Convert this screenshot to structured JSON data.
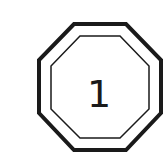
{
  "badge": {
    "label": "1",
    "shape": "octagon",
    "stroke_color": "#1a1a1a",
    "fill_color": "#ffffff"
  }
}
